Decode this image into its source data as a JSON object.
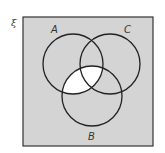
{
  "diagram": {
    "type": "venn",
    "universal_set_symbol": "ξ",
    "sets": [
      {
        "id": "A",
        "label": "A",
        "cx": 73,
        "cy": 64,
        "r": 30
      },
      {
        "id": "C",
        "label": "C",
        "cx": 110,
        "cy": 64,
        "r": 30
      },
      {
        "id": "B",
        "label": "B",
        "cx": 92,
        "cy": 96,
        "r": 30
      }
    ],
    "shaded_region": "A ∩ B",
    "colors": {
      "background_fill": "#d4d4d4",
      "shaded_fill": "#ffffff",
      "outline": "#222222",
      "border": "#333333"
    }
  }
}
